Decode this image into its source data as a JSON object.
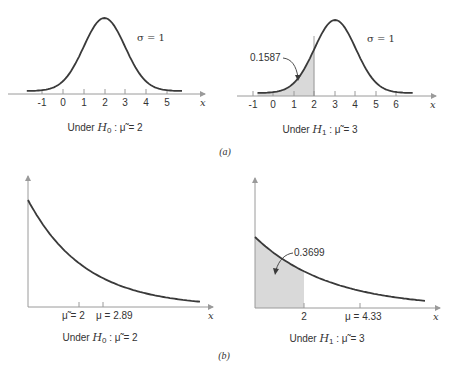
{
  "chart_data": [
    {
      "type": "line",
      "panel": "a-left",
      "title": "",
      "distribution": "normal",
      "mean": 2,
      "sigma": 1,
      "xlabel": "x",
      "x_ticks": [
        -1,
        0,
        1,
        2,
        3,
        4,
        5
      ],
      "annotations": [
        "σ = 1"
      ],
      "caption": "Under H0 : μ̃ = 2"
    },
    {
      "type": "area",
      "panel": "a-right",
      "distribution": "normal",
      "mean": 3,
      "sigma": 1,
      "xlabel": "x",
      "x_ticks": [
        -1,
        0,
        1,
        2,
        3,
        4,
        5,
        6
      ],
      "shaded_region": {
        "from": -0.75,
        "to": 2,
        "area": 0.1587
      },
      "annotations": [
        "σ = 1",
        "0.1587"
      ],
      "caption": "Under H1 : μ̃ = 3"
    },
    {
      "type": "line",
      "panel": "b-left",
      "distribution": "exponential",
      "median": 2,
      "mean": 2.89,
      "xlabel": "x",
      "x_ticks": [
        "μ̃ = 2",
        "μ = 2.89"
      ],
      "caption": "Under H0 : μ̃ = 2"
    },
    {
      "type": "area",
      "panel": "b-right",
      "distribution": "exponential",
      "median": 3,
      "mean": 4.33,
      "xlabel": "x",
      "x_ticks": [
        "2",
        "μ = 4.33"
      ],
      "shaded_region": {
        "from": 0,
        "to": 2,
        "area": 0.3699
      },
      "annotations": [
        "0.3699"
      ],
      "caption": "Under H1 : μ̃ = 3"
    }
  ],
  "labels": {
    "a_left": {
      "ticks": [
        "-1",
        "0",
        "1",
        "2",
        "3",
        "4",
        "5"
      ],
      "sigma": "σ = 1",
      "x": "x",
      "caption_prefix": "Under ",
      "caption_H": "H",
      "caption_sub": "0",
      "caption_suffix": " : μ̃ = 2"
    },
    "a_right": {
      "ticks": [
        "-1",
        "0",
        "1",
        "2",
        "3",
        "4",
        "5",
        "6"
      ],
      "sigma": "σ = 1",
      "area": "0.1587",
      "x": "x",
      "caption_prefix": "Under ",
      "caption_H": "H",
      "caption_sub": "1",
      "caption_suffix": " : μ̃ = 3"
    },
    "b_left": {
      "tick1": "μ̃ = 2",
      "tick2": "μ = 2.89",
      "x": "x",
      "caption_prefix": "Under ",
      "caption_H": "H",
      "caption_sub": "0",
      "caption_suffix": " : μ̃ = 2"
    },
    "b_right": {
      "tick1": "2",
      "tick2": "μ = 4.33",
      "area": "0.3699",
      "x": "x",
      "caption_prefix": "Under ",
      "caption_H": "H",
      "caption_sub": "1",
      "caption_suffix": " : μ̃ = 3"
    },
    "panel_a": "(a)",
    "panel_b": "(b)"
  },
  "colors": {
    "curve": "#3a3a3a",
    "axis": "#9a9a9a",
    "shade": "#d9d9d9"
  }
}
